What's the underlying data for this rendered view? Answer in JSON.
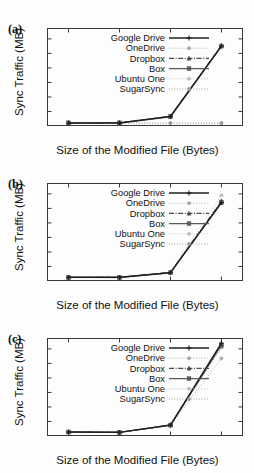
{
  "figure": {
    "background": "#fdfdfd",
    "axis_color": "#3a3a3a",
    "text_color": "#111111"
  },
  "panels": [
    {
      "id": "a",
      "label": "(a)"
    },
    {
      "id": "b",
      "label": "(b)"
    },
    {
      "id": "c",
      "label": "(c)"
    }
  ],
  "axis": {
    "ylabel": "Sync Traffic (MB)",
    "xlabel": "Size of the Modified File (Bytes)",
    "yticks": [
      "0",
      "0.2",
      "0.4",
      "0.6",
      "0.8",
      "1",
      "1.2"
    ],
    "ytick_values": [
      0,
      0.2,
      0.4,
      0.6,
      0.8,
      1,
      1.2
    ],
    "xticks": [
      "1K",
      "10K",
      "100K",
      "1M"
    ]
  },
  "legend": {
    "entries": [
      {
        "label": "Google Drive",
        "color": "#1f1f1f",
        "marker": "plus",
        "dash": "none",
        "width": 1.5
      },
      {
        "label": "OneDrive",
        "color": "#a8a8a8",
        "marker": "dot",
        "dash": "dotted",
        "width": 1.0
      },
      {
        "label": "Dropbox",
        "color": "#4a4a4a",
        "marker": "triangle",
        "dash": "dashdot",
        "width": 1.1
      },
      {
        "label": "Box",
        "color": "#5a5a5a",
        "marker": "square",
        "dash": "none",
        "width": 1.2
      },
      {
        "label": "Ubuntu One",
        "color": "#bcbcbc",
        "marker": "dot",
        "dash": "dotted",
        "width": 1.0
      },
      {
        "label": "SugarSync",
        "color": "#9a9a9a",
        "marker": "dot",
        "dash": "dotted",
        "width": 1.0
      }
    ]
  },
  "chart_data": [
    {
      "type": "line",
      "panel": "(a)",
      "title": "",
      "xlabel": "Size of the Modified File (Bytes)",
      "ylabel": "Sync Traffic (MB)",
      "categories": [
        "1K",
        "10K",
        "100K",
        "1M"
      ],
      "ylim": [
        0,
        1.35
      ],
      "grid": false,
      "legend_position": "top-center",
      "series": [
        {
          "name": "Google Drive",
          "values": [
            0.04,
            0.04,
            0.13,
            1.1
          ]
        },
        {
          "name": "OneDrive",
          "values": [
            0.04,
            0.04,
            0.12,
            1.1
          ]
        },
        {
          "name": "Dropbox",
          "values": [
            0.04,
            0.045,
            0.135,
            1.11
          ]
        },
        {
          "name": "Box",
          "values": [
            0.045,
            0.045,
            0.13,
            1.1
          ]
        },
        {
          "name": "Ubuntu One",
          "values": [
            0.04,
            0.04,
            0.04,
            0.04
          ]
        },
        {
          "name": "SugarSync",
          "values": [
            0.04,
            0.04,
            0.04,
            0.04
          ]
        }
      ]
    },
    {
      "type": "line",
      "panel": "(b)",
      "title": "",
      "xlabel": "Size of the Modified File (Bytes)",
      "ylabel": "Sync Traffic (MB)",
      "categories": [
        "1K",
        "10K",
        "100K",
        "1M"
      ],
      "ylim": [
        0,
        1.35
      ],
      "grid": false,
      "legend_position": "top-center",
      "series": [
        {
          "name": "Google Drive",
          "values": [
            0.05,
            0.05,
            0.115,
            1.08
          ]
        },
        {
          "name": "OneDrive",
          "values": [
            0.045,
            0.04,
            0.11,
            1.09
          ]
        },
        {
          "name": "Dropbox",
          "values": [
            0.05,
            0.05,
            0.12,
            1.1
          ]
        },
        {
          "name": "Box",
          "values": [
            0.05,
            0.05,
            0.115,
            1.08
          ]
        },
        {
          "name": "Ubuntu One",
          "values": [
            0.045,
            0.045,
            0.12,
            1.18
          ]
        },
        {
          "name": "SugarSync",
          "values": [
            0.05,
            0.045,
            0.115,
            1.1
          ]
        }
      ]
    },
    {
      "type": "line",
      "panel": "(c)",
      "title": "",
      "xlabel": "Size of the Modified File (Bytes)",
      "ylabel": "Sync Traffic (MB)",
      "categories": [
        "1K",
        "10K",
        "100K",
        "1M"
      ],
      "ylim": [
        0,
        1.35
      ],
      "grid": false,
      "legend_position": "top-center",
      "series": [
        {
          "name": "Google Drive",
          "values": [
            0.055,
            0.05,
            0.15,
            1.28
          ]
        },
        {
          "name": "OneDrive",
          "values": [
            0.05,
            0.05,
            0.145,
            1.07
          ]
        },
        {
          "name": "Dropbox",
          "values": [
            0.055,
            0.05,
            0.15,
            1.27
          ]
        },
        {
          "name": "Box",
          "values": [
            0.055,
            0.05,
            0.15,
            1.25
          ]
        },
        {
          "name": "Ubuntu One",
          "values": [
            0.05,
            0.05,
            0.145,
            1.23
          ]
        },
        {
          "name": "SugarSync",
          "values": [
            0.05,
            0.05,
            0.145,
            1.22
          ]
        }
      ]
    }
  ]
}
